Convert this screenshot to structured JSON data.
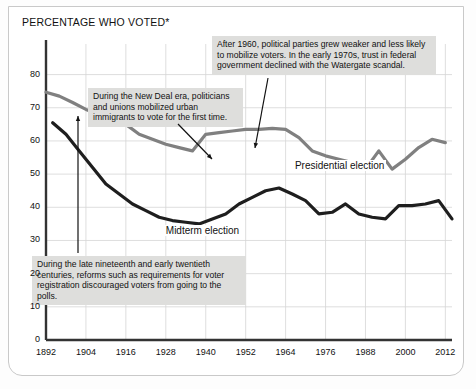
{
  "chart_data": {
    "type": "line",
    "title": "",
    "ylabel": "PERCENTAGE WHO VOTED*",
    "xlabel": "",
    "ylim": [
      0,
      85
    ],
    "yticks": [
      0,
      10,
      20,
      30,
      40,
      50,
      60,
      70,
      80
    ],
    "xlim": [
      1892,
      2014
    ],
    "xticks": [
      1892,
      1904,
      1916,
      1928,
      1940,
      1952,
      1964,
      1976,
      1988,
      2000,
      2012
    ],
    "grid": true,
    "legend_position": "inline-labels",
    "series": [
      {
        "name": "Presidential election",
        "color": "#808080",
        "x": [
          1892,
          1896,
          1900,
          1904,
          1908,
          1912,
          1916,
          1920,
          1924,
          1928,
          1932,
          1936,
          1940,
          1944,
          1948,
          1952,
          1956,
          1960,
          1964,
          1968,
          1972,
          1976,
          1980,
          1984,
          1988,
          1992,
          1996,
          2000,
          2004,
          2008,
          2012
        ],
        "values": [
          74.7,
          73.5,
          71.6,
          69.5,
          68.0,
          66.0,
          65.0,
          62.0,
          60.5,
          59.0,
          58.0,
          57.0,
          62.0,
          62.5,
          63.0,
          63.5,
          63.5,
          63.8,
          63.5,
          61.0,
          57.0,
          55.5,
          54.5,
          53.5,
          51.5,
          57.0,
          51.5,
          54.5,
          58.0,
          60.5,
          59.5
        ]
      },
      {
        "name": "Midterm election",
        "color": "#1e1e1e",
        "x": [
          1894,
          1898,
          1902,
          1906,
          1910,
          1914,
          1918,
          1922,
          1926,
          1930,
          1934,
          1938,
          1942,
          1946,
          1950,
          1954,
          1958,
          1962,
          1966,
          1970,
          1974,
          1978,
          1982,
          1986,
          1990,
          1994,
          1998,
          2002,
          2006,
          2010,
          2014
        ],
        "values": [
          65.5,
          62.0,
          57.0,
          52.0,
          47.0,
          44.0,
          41.0,
          39.0,
          37.0,
          36.0,
          35.5,
          35.0,
          36.5,
          38.0,
          41.0,
          43.0,
          45.0,
          45.8,
          44.0,
          42.0,
          38.0,
          38.5,
          41.0,
          38.0,
          37.0,
          36.5,
          40.5,
          40.5,
          41.0,
          42.0,
          36.5
        ]
      }
    ],
    "annotations": [
      {
        "id": "new-deal",
        "text": "During the New Deal era, politicians and unions mobilized urban immigrants to vote for the first time.",
        "points_to": "Presidential line near 1932–1940 trough"
      },
      {
        "id": "after-1960",
        "text": "After 1960, political parties grew weaker and less likely to mobilize voters. In the early 1970s, trust in federal government declined with the Watergate scandal.",
        "points_to": "Presidential line near 1964"
      },
      {
        "id": "late-nineteenth",
        "text": "During the late nineteenth and early twentieth centuries, reforms such as requirements for voter registration discouraged voters from going to the polls.",
        "points_to": "Lines near 1892"
      }
    ]
  },
  "labels": {
    "presidential": "Presidential election",
    "midterm": "Midterm election"
  }
}
